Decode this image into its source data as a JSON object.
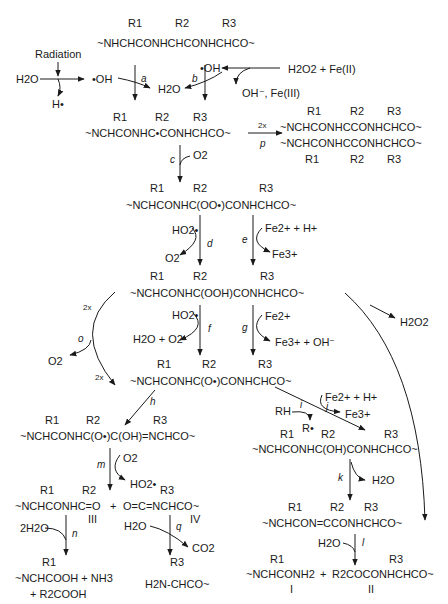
{
  "diagram": {
    "type": "reaction-scheme",
    "initiation": {
      "water": "H2O",
      "radiation_label": "Radiation",
      "h_radical": "H•",
      "hydroxyl_radical": "•OH",
      "fenton_reagents": "H2O2 + Fe(II)",
      "fenton_products": "OH⁻, Fe(III)",
      "water_product": "H2O"
    },
    "species": {
      "s1": "~NHCHCONHCHCONHCHCO~",
      "s2": "~NCHCONHC•CONHCHCO~",
      "s_dimer_top": "~NCHCONHCCONHCHCO~",
      "s_dimer_bottom": "~NCHCONHCCONHCHCO~",
      "s3": "~NCHCONHC(OO•)CONHCHCO~",
      "s4": "~NCHCONHC(OOH)CONHCHCO~",
      "s5": "~NCHCONHC(O•)CONHCHCO~",
      "s6": "~NCHCONHC(O•)C(OH)=NCHCO~",
      "s7": "~NCHCONHC(OH)CONHCHCO~",
      "s8": "~NCHCON=CCONHCHCO~",
      "III": "~NCHCONHC=O",
      "IV": "O=C=NCHCO~",
      "n_products_1": "~NCHCOOH + NH3",
      "n_products_2": "+ R2COOH",
      "q_product": "H2N-CHCO~",
      "I": "~NCHCONH2",
      "II": "R2COCONHCHCO~"
    },
    "substituents": [
      "R1",
      "R2",
      "R3"
    ],
    "compound_labels": [
      "I",
      "II",
      "III",
      "IV"
    ],
    "steps": [
      {
        "id": "a",
        "reagents": "•OH",
        "products": "H2O"
      },
      {
        "id": "b",
        "reagents": "•OH",
        "products": "H2O"
      },
      {
        "id": "c",
        "reagents": "O2",
        "products": ""
      },
      {
        "id": "d",
        "reagents": "HO2•",
        "products": "O2"
      },
      {
        "id": "e",
        "reagents": "Fe2+ + H+",
        "products": "Fe3+"
      },
      {
        "id": "f",
        "reagents": "HO2•",
        "products": "H2O + O2"
      },
      {
        "id": "g",
        "reagents": "Fe2+",
        "products": "Fe3+ + OH⁻"
      },
      {
        "id": "h",
        "reagents": "",
        "products": ""
      },
      {
        "id": "i",
        "reagents": "RH",
        "products": "R•"
      },
      {
        "id": "j",
        "reagents": "Fe2+ + H+",
        "products": "Fe3+"
      },
      {
        "id": "k",
        "reagents": "",
        "products": "H2O"
      },
      {
        "id": "l",
        "reagents": "H2O",
        "products": ""
      },
      {
        "id": "m",
        "reagents": "O2",
        "products": "HO2•"
      },
      {
        "id": "n",
        "reagents": "2H2O",
        "products": ""
      },
      {
        "id": "o",
        "reagents": "2x",
        "products": "O2"
      },
      {
        "id": "p",
        "reagents": "2x",
        "products": ""
      },
      {
        "id": "q",
        "reagents": "H2O",
        "products": "CO2"
      }
    ],
    "side_products": {
      "h2o2": "H2O2",
      "two_x": "2x"
    }
  }
}
